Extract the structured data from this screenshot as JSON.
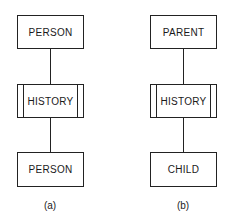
{
  "diagrams": [
    {
      "id": "a",
      "caption": "(a)",
      "top_entity": "PERSON",
      "relationship": "HISTORY",
      "bottom_entity": "PERSON"
    },
    {
      "id": "b",
      "caption": "(b)",
      "top_entity": "PARENT",
      "relationship": "HISTORY",
      "bottom_entity": "CHILD"
    }
  ]
}
